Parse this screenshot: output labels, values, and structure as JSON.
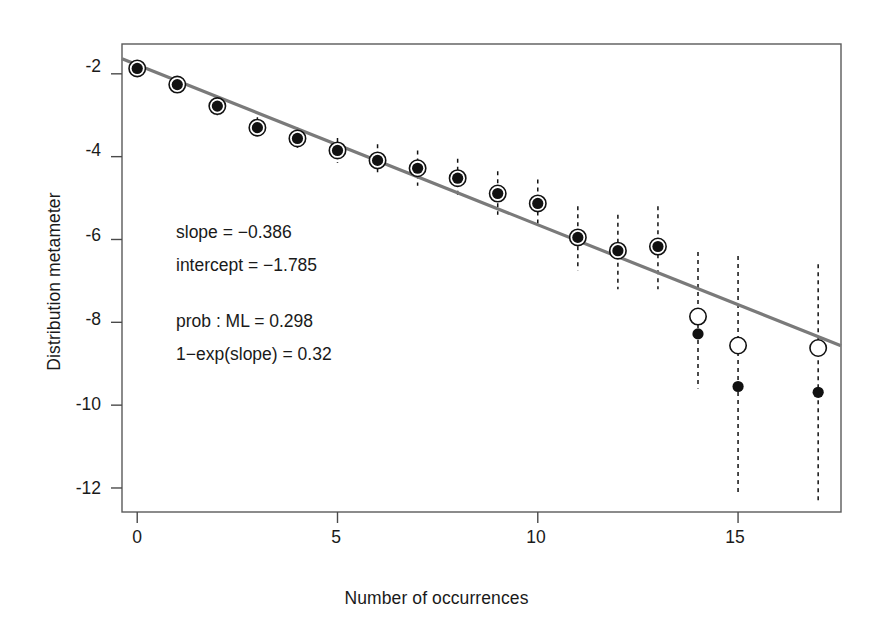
{
  "chart_data": {
    "type": "scatter",
    "title": "",
    "subtitle": "",
    "xlabel": "Number of occurrences",
    "ylabel": "Distribution metameter",
    "xlim": [
      -0.38,
      17.57
    ],
    "ylim": [
      -12.58,
      -1.28
    ],
    "xticks": [
      0,
      5,
      10,
      15
    ],
    "yticks": [
      -2,
      -4,
      -6,
      -8,
      -10,
      -12
    ],
    "xtick_labels": [
      "0",
      "5",
      "10",
      "15"
    ],
    "ytick_labels": [
      "-2",
      "-4",
      "-6",
      "-8",
      "-10",
      "-12"
    ],
    "grid": false,
    "legend": null,
    "frame": true,
    "x": [
      0,
      1,
      2,
      3,
      4,
      5,
      6,
      7,
      8,
      9,
      10,
      11,
      12,
      13,
      14,
      15,
      17
    ],
    "series": [
      {
        "name": "expected (open circle)",
        "marker": "open-circle",
        "values": [
          -1.87,
          -2.26,
          -2.78,
          -3.3,
          -3.56,
          -3.85,
          -4.09,
          -4.28,
          -4.52,
          -4.89,
          -5.13,
          -5.95,
          -6.27,
          -6.17,
          -7.86,
          -8.56,
          -8.62
        ]
      },
      {
        "name": "observed (filled dot)",
        "marker": "filled-dot",
        "values": [
          -1.87,
          -2.26,
          -2.78,
          -3.3,
          -3.56,
          -3.85,
          -4.09,
          -4.28,
          -4.52,
          -4.89,
          -5.13,
          -5.95,
          -6.27,
          -6.17,
          -8.28,
          -9.55,
          -9.69
        ]
      }
    ],
    "error_bars": {
      "style": "dashed-vertical",
      "lower": [
        -2.0,
        -2.45,
        -3.0,
        -3.5,
        -3.8,
        -4.15,
        -4.45,
        -4.7,
        -5.0,
        -5.4,
        -5.7,
        -6.75,
        -7.2,
        -7.2,
        -9.6,
        -12.1,
        -12.3
      ],
      "upper": [
        -1.7,
        -2.05,
        -2.55,
        -3.05,
        -3.3,
        -3.55,
        -3.7,
        -3.85,
        -4.05,
        -4.35,
        -4.55,
        -5.2,
        -5.4,
        -5.2,
        -6.3,
        -6.4,
        -6.6
      ]
    },
    "fit_line": {
      "name": "regression line",
      "color": "#7a7a7a",
      "slope": -0.386,
      "intercept": -1.785,
      "x_start": -0.38,
      "x_end": 17.57
    },
    "annotations": [
      "slope = −0.386",
      "intercept = −1.785",
      "prob : ML = 0.298",
      "1−exp(slope) = 0.32"
    ]
  },
  "annotation_block": {
    "line1": "slope = −0.386",
    "line2": "intercept = −1.785",
    "line3": "prob : ML = 0.298",
    "line4": "1−exp(slope) = 0.32"
  },
  "axes": {
    "x_title": "Number of occurrences",
    "y_title": "Distribution metameter",
    "x_tick_0": "0",
    "x_tick_1": "5",
    "x_tick_2": "10",
    "x_tick_3": "15",
    "y_tick_0": "-2",
    "y_tick_1": "-4",
    "y_tick_2": "-6",
    "y_tick_3": "-8",
    "y_tick_4": "-10",
    "y_tick_5": "-12"
  },
  "colors": {
    "line": "#7a7a7a",
    "marker": "#111111",
    "frame": "#4a4a4a",
    "text": "#1a1a1a",
    "background": "#ffffff"
  }
}
